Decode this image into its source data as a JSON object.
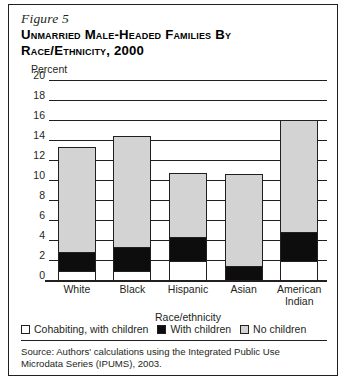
{
  "figure": {
    "number_label": "Figure 5",
    "title_line1": "Unmarried Male-Headed Families by",
    "title_line2": "Race/Ethnicity, 2000",
    "percent_axis_label": "Percent",
    "source_note": "Source: Authors' calculations using the Integrated Public Use Microdata Series (IPUMS), 2003."
  },
  "legend": {
    "items": [
      {
        "label": "Cohabiting, with children",
        "key": "cohab",
        "color": "#ffffff"
      },
      {
        "label": "With children",
        "key": "with",
        "color": "#0d0d0d"
      },
      {
        "label": "No children",
        "key": "no",
        "color": "#d3d3d3"
      }
    ]
  },
  "chart_data": {
    "type": "bar",
    "stacked": true,
    "title": "Unmarried Male-Headed Families by Race/Ethnicity, 2000",
    "xlabel": "Race/ethnicity",
    "ylabel": "Percent",
    "ylim": [
      0,
      20
    ],
    "yticks": [
      0,
      2,
      4,
      6,
      8,
      10,
      12,
      14,
      16,
      18,
      20
    ],
    "grid": true,
    "legend_position": "bottom",
    "categories": [
      "White",
      "Black",
      "Hispanic",
      "Asian",
      "American Indian"
    ],
    "category_lines": [
      [
        "White"
      ],
      [
        "Black"
      ],
      [
        "Hispanic"
      ],
      [
        "Asian"
      ],
      [
        "American",
        "Indian"
      ]
    ],
    "series": [
      {
        "name": "Cohabiting, with children",
        "values": [
          1.0,
          1.0,
          2.0,
          0.0,
          2.0
        ]
      },
      {
        "name": "With children",
        "values": [
          2.0,
          2.5,
          2.5,
          1.5,
          3.0
        ]
      },
      {
        "name": "No children",
        "values": [
          10.6,
          11.2,
          6.5,
          9.3,
          11.3
        ]
      }
    ],
    "totals": [
      13.6,
      14.7,
      11.0,
      10.8,
      16.3
    ]
  }
}
